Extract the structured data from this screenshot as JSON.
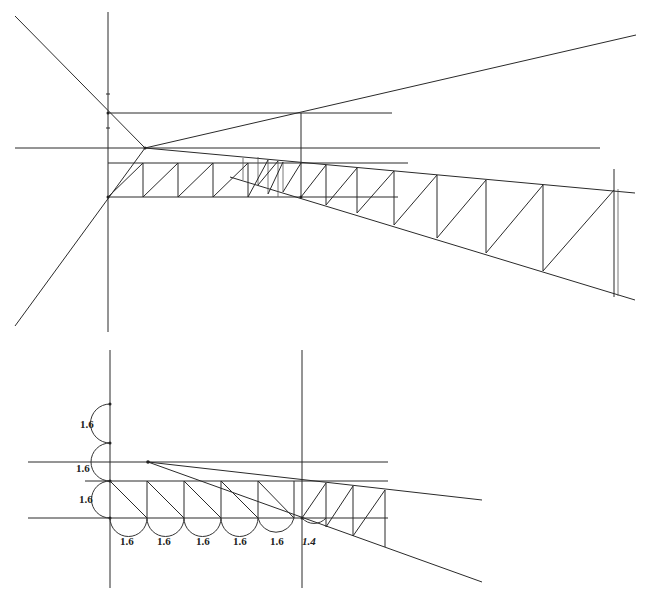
{
  "top_cutoff_text": "",
  "figure_top": {
    "description": "Perspective construction of a tapering truss with diagonal bracing",
    "axis_vertical_x": 108,
    "vanishing_point": [
      145,
      148
    ]
  },
  "figure_bottom": {
    "description": "Measured subdivision construction using semicircular arcs",
    "vertical_labels": [
      "1.6",
      "1.6",
      "1.6"
    ],
    "horizontal_labels": [
      "1.6",
      "1.6",
      "1.6",
      "1.6",
      "1.6",
      "1.4"
    ]
  },
  "colors": {
    "line": "#2a2a2a",
    "background": "#ffffff"
  }
}
